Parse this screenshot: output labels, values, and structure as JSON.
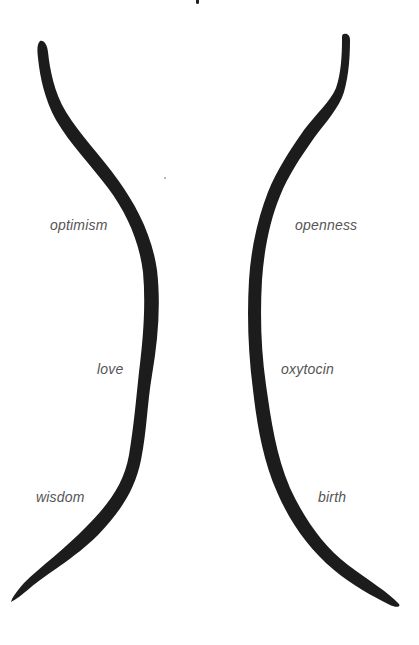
{
  "diagram": {
    "type": "two-curved-lines-hourglass",
    "colors": {
      "stroke": "#1c1c1c",
      "label": "#555555",
      "background": "#ffffff"
    },
    "left_curve": {
      "labels": [
        {
          "text": "optimism",
          "x": 50,
          "y": 217
        },
        {
          "text": "love",
          "x": 97,
          "y": 361
        },
        {
          "text": "wisdom",
          "x": 36,
          "y": 489
        }
      ]
    },
    "right_curve": {
      "labels": [
        {
          "text": "openness",
          "x": 295,
          "y": 217
        },
        {
          "text": "oxytocin",
          "x": 281,
          "y": 361
        },
        {
          "text": "birth",
          "x": 318,
          "y": 489
        }
      ]
    }
  }
}
